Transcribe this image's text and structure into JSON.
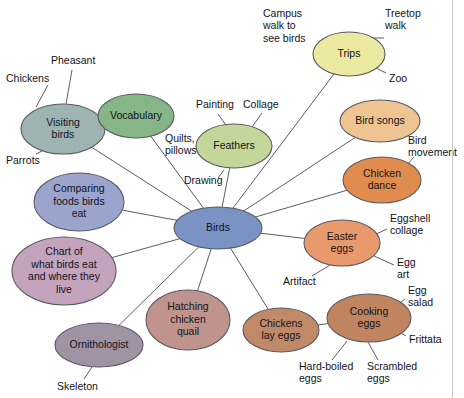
{
  "diagram": {
    "title_clipped": "",
    "type": "mind-map",
    "background_color": "#ffffff",
    "edge_color": "#4a4a52",
    "center": {
      "id": "birds",
      "label": "Birds",
      "cx": 218,
      "cy": 228,
      "rx": 44,
      "ry": 21,
      "fill": "#7b93c4",
      "stroke": "#4a5878"
    },
    "nodes": [
      {
        "id": "visiting-birds",
        "label": "Visiting birds",
        "lines": [
          "Visiting",
          "birds"
        ],
        "cx": 63,
        "cy": 129,
        "rx": 42,
        "ry": 25,
        "fill": "#9db4b3",
        "stroke": "#5d6f6e"
      },
      {
        "id": "vocabulary",
        "label": "Vocabulary",
        "lines": [
          "Vocabulary"
        ],
        "cx": 136,
        "cy": 116,
        "rx": 38,
        "ry": 22,
        "fill": "#86b587",
        "stroke": "#4f7350"
      },
      {
        "id": "feathers",
        "label": "Feathers",
        "lines": [
          "Feathers"
        ],
        "cx": 234,
        "cy": 146,
        "rx": 38,
        "ry": 22,
        "fill": "#c3d79a",
        "stroke": "#7d8f5c"
      },
      {
        "id": "trips",
        "label": "Trips",
        "lines": [
          "Trips"
        ],
        "cx": 349,
        "cy": 54,
        "rx": 36,
        "ry": 22,
        "fill": "#ece9a0",
        "stroke": "#a8a45f"
      },
      {
        "id": "bird-songs",
        "label": "Bird songs",
        "lines": [
          "Bird songs"
        ],
        "cx": 380,
        "cy": 121,
        "rx": 40,
        "ry": 21,
        "fill": "#eec592",
        "stroke": "#a87c45"
      },
      {
        "id": "chicken-dance",
        "label": "Chicken dance",
        "lines": [
          "Chicken",
          "dance"
        ],
        "cx": 382,
        "cy": 180,
        "rx": 39,
        "ry": 23,
        "fill": "#e08c4f",
        "stroke": "#a05f2c"
      },
      {
        "id": "easter-eggs",
        "label": "Easter eggs",
        "lines": [
          "Easter",
          "eggs"
        ],
        "cx": 342,
        "cy": 243,
        "rx": 38,
        "ry": 23,
        "fill": "#e89a6d",
        "stroke": "#a56340"
      },
      {
        "id": "cooking-eggs",
        "label": "Cooking eggs",
        "lines": [
          "Cooking",
          "eggs"
        ],
        "cx": 369,
        "cy": 318,
        "rx": 42,
        "ry": 24,
        "fill": "#c08560",
        "stroke": "#86573a"
      },
      {
        "id": "chickens-lay-eggs",
        "label": "Chickens lay eggs",
        "lines": [
          "Chickens",
          "lay eggs"
        ],
        "cx": 281,
        "cy": 330,
        "rx": 38,
        "ry": 22,
        "fill": "#c08a68",
        "stroke": "#86573a"
      },
      {
        "id": "hatching-chicken-quail",
        "label": "Hatching chicken quail",
        "lines": [
          "Hatching",
          "chicken",
          "quail"
        ],
        "cx": 188,
        "cy": 320,
        "rx": 42,
        "ry": 30,
        "fill": "#c0948c",
        "stroke": "#86605a"
      },
      {
        "id": "ornithologist",
        "label": "Ornithologist",
        "lines": [
          "Ornithologist"
        ],
        "cx": 99,
        "cy": 345,
        "rx": 44,
        "ry": 22,
        "fill": "#9f93a4",
        "stroke": "#6a6070"
      },
      {
        "id": "chart-of-what-birds-eat",
        "label": "Chart of what birds eat and where they live",
        "lines": [
          "Chart of",
          "what birds eat",
          "and where they",
          "live"
        ],
        "cx": 64,
        "cy": 271,
        "rx": 52,
        "ry": 34,
        "fill": "#c4a3bd",
        "stroke": "#896283"
      },
      {
        "id": "comparing-foods-birds-eat",
        "label": "Comparing foods birds eat",
        "lines": [
          "Comparing",
          "foods birds",
          "eat"
        ],
        "cx": 79,
        "cy": 202,
        "rx": 45,
        "ry": 29,
        "fill": "#9aa4cd",
        "stroke": "#5e6a96"
      }
    ],
    "leaves": [
      {
        "id": "chickens",
        "label": "Chickens",
        "x": 6,
        "y": 79,
        "anchor": "start",
        "line": {
          "x1": 48,
          "y1": 85,
          "x2": 36,
          "y2": 107
        }
      },
      {
        "id": "pheasant",
        "label": "Pheasant",
        "x": 51,
        "y": 61,
        "anchor": "start",
        "line": {
          "x1": 72,
          "y1": 70,
          "x2": 66,
          "y2": 104
        }
      },
      {
        "id": "parrots",
        "label": "Parrots",
        "x": 6,
        "y": 161,
        "anchor": "start",
        "line": {
          "x1": 36,
          "y1": 154,
          "x2": 50,
          "y2": 147
        }
      },
      {
        "id": "painting",
        "label": "Painting",
        "x": 196,
        "y": 105,
        "anchor": "start",
        "line": {
          "x1": 218,
          "y1": 114,
          "x2": 226,
          "y2": 125
        }
      },
      {
        "id": "collage",
        "label": "Collage",
        "x": 243,
        "y": 105,
        "anchor": "start",
        "line": {
          "x1": 262,
          "y1": 113,
          "x2": 252,
          "y2": 127
        }
      },
      {
        "id": "quilts-pillows",
        "label": "Quilts, pillows",
        "lines": [
          "Quilts,",
          "pillows"
        ],
        "x": 165,
        "y": 139,
        "anchor": "start",
        "line": {
          "x1": 203,
          "y1": 145,
          "x2": 196,
          "y2": 145
        }
      },
      {
        "id": "drawing",
        "label": "Drawing",
        "x": 184,
        "y": 181,
        "anchor": "start",
        "line": {
          "x1": 224,
          "y1": 170,
          "x2": 218,
          "y2": 178
        }
      },
      {
        "id": "campus-walk",
        "label": "Campus walk to see birds",
        "lines": [
          "Campus",
          "walk to",
          "see birds"
        ],
        "x": 263,
        "y": 14,
        "anchor": "start",
        "line": {
          "x1": 318,
          "y1": 44,
          "x2": 326,
          "y2": 43
        }
      },
      {
        "id": "treetop-walk",
        "label": "Treetop walk",
        "lines": [
          "Treetop",
          "walk"
        ],
        "x": 385,
        "y": 14,
        "anchor": "start",
        "line": {
          "x1": 384,
          "y1": 38,
          "x2": 368,
          "y2": 38
        }
      },
      {
        "id": "zoo",
        "label": "Zoo",
        "x": 389,
        "y": 79,
        "anchor": "start",
        "line": {
          "x1": 386,
          "y1": 73,
          "x2": 372,
          "y2": 66
        }
      },
      {
        "id": "bird-movement",
        "label": "Bird movement",
        "lines": [
          "Bird",
          "movement"
        ],
        "x": 408,
        "y": 141,
        "anchor": "start",
        "line": {
          "x1": 414,
          "y1": 157,
          "x2": 404,
          "y2": 168
        }
      },
      {
        "id": "eggshell-collage",
        "label": "Eggshell collage",
        "lines": [
          "Eggshell",
          "collage"
        ],
        "x": 390,
        "y": 219,
        "anchor": "start",
        "line": {
          "x1": 387,
          "y1": 229,
          "x2": 372,
          "y2": 236
        }
      },
      {
        "id": "egg-art",
        "label": "Egg art",
        "lines": [
          "Egg",
          "art"
        ],
        "x": 397,
        "y": 263,
        "anchor": "start",
        "line": {
          "x1": 394,
          "y1": 265,
          "x2": 374,
          "y2": 256
        }
      },
      {
        "id": "artifact",
        "label": "Artifact",
        "x": 283,
        "y": 282,
        "anchor": "start",
        "line": {
          "x1": 312,
          "y1": 276,
          "x2": 330,
          "y2": 265
        }
      },
      {
        "id": "egg-salad",
        "label": "Egg salad",
        "lines": [
          "Egg",
          "salad"
        ],
        "x": 408,
        "y": 291,
        "anchor": "start",
        "line": {
          "x1": 405,
          "y1": 299,
          "x2": 396,
          "y2": 306
        }
      },
      {
        "id": "frittata",
        "label": "Frittata",
        "x": 409,
        "y": 340,
        "anchor": "start",
        "line": {
          "x1": 406,
          "y1": 336,
          "x2": 396,
          "y2": 330
        }
      },
      {
        "id": "scrambled-eggs",
        "label": "Scrambled eggs",
        "lines": [
          "Scrambled",
          "eggs"
        ],
        "x": 367,
        "y": 367,
        "anchor": "start",
        "line": {
          "x1": 378,
          "y1": 360,
          "x2": 368,
          "y2": 342
        }
      },
      {
        "id": "hard-boiled-eggs",
        "label": "Hard-boiled eggs",
        "lines": [
          "Hard-boiled",
          "eggs"
        ],
        "x": 299,
        "y": 367,
        "anchor": "start",
        "line": {
          "x1": 332,
          "y1": 360,
          "x2": 347,
          "y2": 341
        }
      },
      {
        "id": "skeleton",
        "label": "Skeleton",
        "x": 57,
        "y": 387,
        "anchor": "start",
        "line": {
          "x1": 84,
          "y1": 379,
          "x2": 92,
          "y2": 367
        }
      }
    ],
    "edges": [
      {
        "from": "birds",
        "to": "visiting-birds"
      },
      {
        "from": "birds",
        "to": "vocabulary"
      },
      {
        "from": "birds",
        "to": "feathers"
      },
      {
        "from": "birds",
        "to": "trips"
      },
      {
        "from": "birds",
        "to": "bird-songs"
      },
      {
        "from": "birds",
        "to": "chicken-dance"
      },
      {
        "from": "birds",
        "to": "easter-eggs"
      },
      {
        "from": "birds",
        "to": "chickens-lay-eggs"
      },
      {
        "from": "birds",
        "to": "hatching-chicken-quail"
      },
      {
        "from": "birds",
        "to": "ornithologist"
      },
      {
        "from": "birds",
        "to": "chart-of-what-birds-eat"
      },
      {
        "from": "birds",
        "to": "comparing-foods-birds-eat"
      },
      {
        "from": "chickens-lay-eggs",
        "to": "cooking-eggs"
      }
    ]
  }
}
